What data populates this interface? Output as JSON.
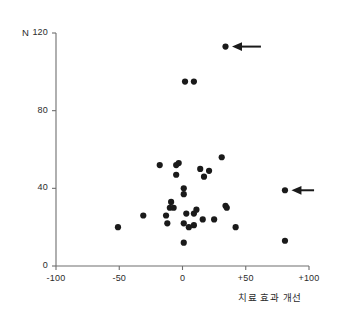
{
  "chart_data": {
    "type": "scatter",
    "title": "",
    "xlabel": "치료 효과 개선",
    "ylabel": "N",
    "xlim": [
      -100,
      100
    ],
    "ylim": [
      0,
      120
    ],
    "xticks": [
      "-100",
      "-50",
      "0",
      "+50",
      "+100"
    ],
    "xtick_values": [
      -100,
      -50,
      0,
      50,
      100
    ],
    "yticks": [
      "0",
      "40",
      "80",
      "120"
    ],
    "ytick_values": [
      0,
      40,
      80,
      120
    ],
    "grid": false,
    "legend": null,
    "marker": "filled-circle",
    "marker_color": "#1a1a1a",
    "axis_color": "#6e6e6e",
    "points": [
      {
        "x": 34,
        "y": 113
      },
      {
        "x": 2,
        "y": 95
      },
      {
        "x": 9,
        "y": 95
      },
      {
        "x": 31,
        "y": 56
      },
      {
        "x": -18,
        "y": 52
      },
      {
        "x": -5,
        "y": 52
      },
      {
        "x": -3,
        "y": 53
      },
      {
        "x": 14,
        "y": 50
      },
      {
        "x": 21,
        "y": 49
      },
      {
        "x": -5,
        "y": 47
      },
      {
        "x": 17,
        "y": 46
      },
      {
        "x": 81,
        "y": 39
      },
      {
        "x": 1,
        "y": 40
      },
      {
        "x": 1,
        "y": 37
      },
      {
        "x": -9,
        "y": 33
      },
      {
        "x": -10,
        "y": 30
      },
      {
        "x": -7,
        "y": 30
      },
      {
        "x": 34,
        "y": 31
      },
      {
        "x": 35,
        "y": 30
      },
      {
        "x": -31,
        "y": 26
      },
      {
        "x": -13,
        "y": 26
      },
      {
        "x": 3,
        "y": 27
      },
      {
        "x": 9,
        "y": 27
      },
      {
        "x": 11,
        "y": 29
      },
      {
        "x": 16,
        "y": 24
      },
      {
        "x": 25,
        "y": 24
      },
      {
        "x": -12,
        "y": 22
      },
      {
        "x": 1,
        "y": 22
      },
      {
        "x": 5,
        "y": 20
      },
      {
        "x": 9,
        "y": 21
      },
      {
        "x": -51,
        "y": 20
      },
      {
        "x": 42,
        "y": 20
      },
      {
        "x": 1,
        "y": 12
      },
      {
        "x": 81,
        "y": 13
      }
    ],
    "annotations": [
      {
        "type": "arrow",
        "direction": "left",
        "target_x": 34,
        "target_y": 113,
        "tail_x": 62,
        "tail_y": 113
      },
      {
        "type": "arrow",
        "direction": "left",
        "target_x": 81,
        "target_y": 39,
        "tail_x": 104,
        "tail_y": 39
      }
    ]
  }
}
